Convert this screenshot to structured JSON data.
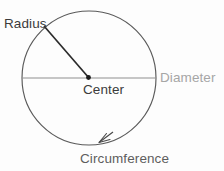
{
  "figure": {
    "background_color": "#fdfdfd",
    "labels": {
      "radius": "Radius",
      "center": "Center",
      "diameter": "Diameter",
      "circumference": "Circumference"
    },
    "colors": {
      "circle_stroke": "#5a5a5a",
      "diameter_line": "#8c8c8c",
      "radius_line": "#2b2b2b",
      "center_dot": "#1a1a1a",
      "arrow": "#4a4a4a",
      "text_dark": "#3b3b3b",
      "text_medium": "#5e5e5e",
      "text_light": "#a6a6a6"
    },
    "geometry": {
      "center_x": 89,
      "center_y": 78,
      "radius": 67,
      "radius_endpoint_x": 44,
      "radius_endpoint_y": 26,
      "diameter_left_x": 22,
      "diameter_right_x": 156,
      "diameter_y": 78,
      "arrow_tip_x": 99,
      "arrow_tip_y": 142
    }
  }
}
